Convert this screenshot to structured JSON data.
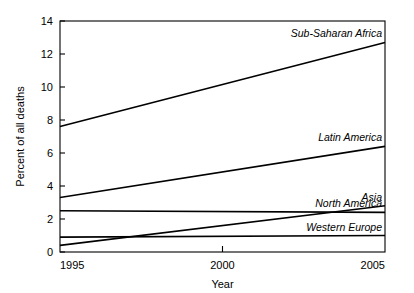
{
  "chart_data": {
    "type": "line",
    "title": "",
    "xlabel": "Year",
    "ylabel": "Percent of all deaths",
    "xlim": [
      1995,
      2005
    ],
    "ylim": [
      0,
      14
    ],
    "xticks": [
      1995,
      2000,
      2005
    ],
    "xtick_labels": [
      "1995",
      "2000",
      "2005"
    ],
    "yticks": [
      0,
      2,
      4,
      6,
      8,
      10,
      12,
      14
    ],
    "ytick_labels": [
      "0",
      "2",
      "4",
      "6",
      "8",
      "10",
      "12",
      "14"
    ],
    "grid": false,
    "legend_position": "inline-right-of-line-end",
    "x": [
      1995,
      2005
    ],
    "series": [
      {
        "name": "Sub-Saharan Africa",
        "values": [
          7.6,
          12.7
        ],
        "color": "#000000"
      },
      {
        "name": "Latin America",
        "values": [
          3.3,
          6.4
        ],
        "color": "#000000"
      },
      {
        "name": "Asia",
        "values": [
          0.4,
          2.8
        ],
        "color": "#000000"
      },
      {
        "name": "North America",
        "values": [
          2.5,
          2.4
        ],
        "color": "#000000"
      },
      {
        "name": "Western Europe",
        "values": [
          0.9,
          1.0
        ],
        "color": "#000000"
      }
    ]
  }
}
